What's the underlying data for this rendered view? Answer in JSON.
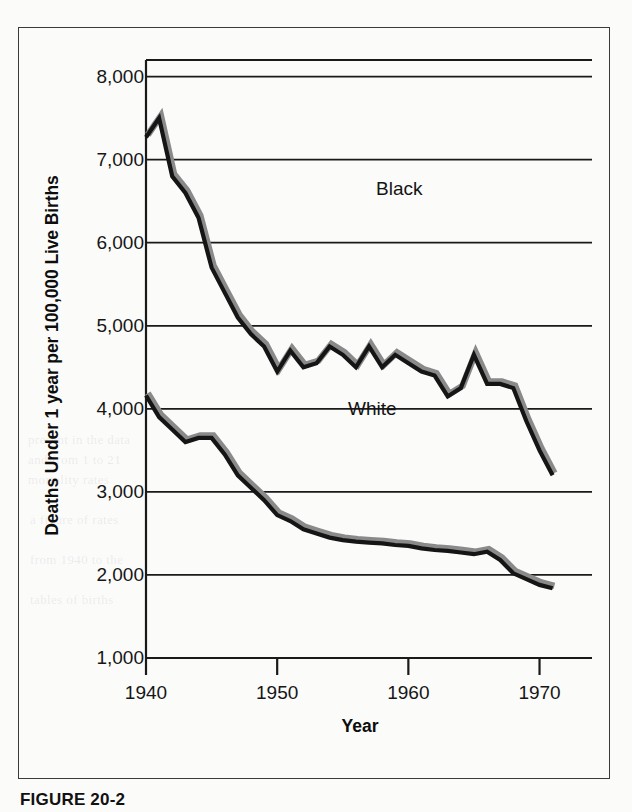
{
  "caption": "FIGURE 20-2",
  "annotations": {
    "black_label": "Black",
    "white_label": "White"
  },
  "colors": {
    "line_stroke": "#151515",
    "line_shadow": "#8a8a8a",
    "axis": "#1a1a1a",
    "frame": "#3a3a3a",
    "page": "#fbfbfa"
  },
  "chart_data": {
    "type": "line",
    "title": "",
    "xlabel": "Year",
    "ylabel": "Deaths Under 1 year per 100,000 Live Births",
    "xlim": [
      1940,
      1974
    ],
    "ylim": [
      1000,
      8200
    ],
    "xticks": [
      1940,
      1950,
      1960,
      1970
    ],
    "xtick_labels": [
      "1940",
      "1950",
      "1960",
      "1970"
    ],
    "yticks": [
      1000,
      2000,
      3000,
      4000,
      5000,
      6000,
      7000,
      8000
    ],
    "ytick_labels": [
      "1,000",
      "2,000",
      "3,000",
      "4,000",
      "5,000",
      "6,000",
      "7,000",
      "8,000"
    ],
    "gridlines": [
      2000,
      3000,
      4000,
      5000,
      6000,
      7000,
      8000
    ],
    "grid": true,
    "legend": "inline-annotation",
    "x": [
      1940,
      1941,
      1942,
      1943,
      1944,
      1945,
      1946,
      1947,
      1948,
      1949,
      1950,
      1951,
      1952,
      1953,
      1954,
      1955,
      1956,
      1957,
      1958,
      1959,
      1960,
      1961,
      1962,
      1963,
      1964,
      1965,
      1966,
      1967,
      1968,
      1969,
      1970,
      1971
    ],
    "series": [
      {
        "name": "Black",
        "values": [
          7270,
          7500,
          6800,
          6600,
          6300,
          5700,
          5400,
          5100,
          4900,
          4750,
          4450,
          4700,
          4500,
          4550,
          4750,
          4650,
          4500,
          4750,
          4500,
          4650,
          4550,
          4450,
          4400,
          4150,
          4250,
          4650,
          4300,
          4300,
          4250,
          3850,
          3500,
          3200
        ]
      },
      {
        "name": "White",
        "values": [
          4160,
          3900,
          3750,
          3600,
          3650,
          3650,
          3450,
          3200,
          3050,
          2900,
          2720,
          2650,
          2550,
          2500,
          2450,
          2420,
          2400,
          2390,
          2380,
          2360,
          2350,
          2320,
          2300,
          2290,
          2270,
          2250,
          2280,
          2180,
          2020,
          1950,
          1880,
          1840
        ]
      }
    ]
  },
  "ghost_text": [
    "present in the data",
    "and from 1 to 21",
    "mortality rates",
    "a figure of rates",
    "from 1940 to the",
    "tables of births"
  ]
}
